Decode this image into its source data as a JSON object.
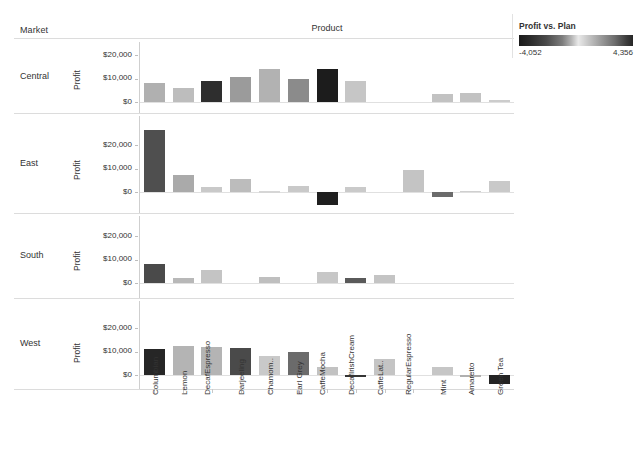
{
  "header": {
    "market_label": "Market",
    "product_label": "Product"
  },
  "legend": {
    "title": "Profit vs. Plan",
    "min_label": "-4,052",
    "max_label": "4,356",
    "name": "profit-vs-plan-color-legend"
  },
  "axis": {
    "y_title": "Profit",
    "y_ticks": [
      "$20,000",
      "$10,000",
      "$0"
    ]
  },
  "chart_data": {
    "type": "bar",
    "title": "",
    "subtitle": "",
    "xlabel": "Product",
    "ylabel": "Profit",
    "ylim": [
      -8000,
      28000
    ],
    "grid": false,
    "legend_position": "top-right",
    "color_legend": {
      "name": "Profit vs. Plan",
      "min": -4052,
      "max": 4356,
      "scheme": "diverging-gray"
    },
    "facet_rows": [
      "Central",
      "East",
      "South",
      "West"
    ],
    "categories": [
      "Columbian",
      "Lemon",
      "Decaf Espresso",
      "Darjeeling",
      "Chamom..",
      "Earl Grey",
      "Caffe Mocha",
      "Decaf Irish Cream",
      "Caffe Lat..",
      "Regular Espresso",
      "Mint",
      "Amaretto",
      "Green Tea"
    ],
    "series": [
      {
        "name": "Central",
        "values": [
          8000,
          6000,
          8800,
          10500,
          14000,
          10000,
          14000,
          9000,
          null,
          null,
          3200,
          4000,
          800
        ],
        "color_values": [
          -900,
          1500,
          -3600,
          -1200,
          900,
          -1800,
          -4052,
          2200,
          null,
          null,
          1700,
          1900,
          2600
        ]
      },
      {
        "name": "East",
        "values": [
          26400,
          7200,
          2200,
          5700,
          400,
          2700,
          -5500,
          2200,
          null,
          9300,
          -2000,
          500,
          4600
        ],
        "color_values": [
          -2300,
          -600,
          2000,
          -700,
          2900,
          2000,
          -4052,
          1700,
          null,
          1200,
          -3000,
          1600,
          2100
        ]
      },
      {
        "name": "South",
        "values": [
          8200,
          2300,
          5500,
          null,
          2700,
          null,
          4500,
          2300,
          3200,
          null,
          null,
          null,
          null
        ],
        "color_values": [
          -3700,
          -1100,
          2300,
          null,
          1000,
          null,
          2200,
          -2800,
          2000,
          null,
          null,
          null,
          null
        ]
      },
      {
        "name": "West",
        "values": [
          11000,
          12500,
          12000,
          11300,
          8000,
          10000,
          3500,
          -1000,
          6700,
          null,
          3500,
          -700,
          -4000
        ],
        "color_values": [
          -4052,
          1200,
          1600,
          -2700,
          3100,
          -2500,
          2400,
          -3900,
          2800,
          null,
          2300,
          -1000,
          -4052
        ]
      }
    ]
  },
  "bar_colors": {
    "Central": [
      "#b0b0b0",
      "#bdbdbd",
      "#2e2e2e",
      "#9b9b9b",
      "#b2b2b2",
      "#8b8b8b",
      "#1c1c1c",
      "#c6c6c6",
      null,
      null,
      "#c2c2c2",
      "#c2c2c2",
      "#cccccc"
    ],
    "East": [
      "#4f4f4f",
      "#aaaaaa",
      "#c9c9c9",
      "#bcbcbc",
      "#d6d6d6",
      "#c9c9c9",
      "#1f1f1f",
      "#cacaca",
      null,
      "#c4c4c4",
      "#6b6b6b",
      "#cfcfcf",
      "#c9c9c9"
    ],
    "South": [
      "#4a4a4a",
      "#b8b8b8",
      "#c4c4c4",
      null,
      "#bfbfbf",
      null,
      "#c7c7c7",
      "#5a5a5a",
      "#c4c4c4",
      null,
      null,
      null,
      null
    ],
    "West": [
      "#262626",
      "#b4b4b4",
      "#b4b4b4",
      "#4a4a4a",
      "#c9c9c9",
      "#6b6b6b",
      "#c2c2c2",
      "#353535",
      "#c4c4c4",
      null,
      "#c6c6c6",
      "#b0b0b0",
      "#242424"
    ]
  },
  "facets": [
    {
      "label": "Central",
      "name": "facet-row-central"
    },
    {
      "label": "East",
      "name": "facet-row-east"
    },
    {
      "label": "South",
      "name": "facet-row-south"
    },
    {
      "label": "West",
      "name": "facet-row-west"
    }
  ]
}
